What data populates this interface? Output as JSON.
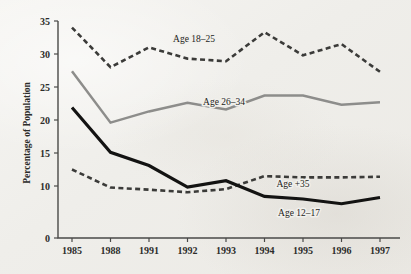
{
  "chart_data": {
    "type": "line",
    "title": "",
    "xlabel": "",
    "ylabel": "Percentage of Population",
    "categories": [
      "1985",
      "1988",
      "1991",
      "1992",
      "1993",
      "1994",
      "1995",
      "1996",
      "1997"
    ],
    "ylim": [
      0,
      35
    ],
    "yticks": [
      0,
      10,
      15,
      20,
      25,
      30,
      35
    ],
    "ytick_labels": [
      "0",
      "10",
      "15",
      "20",
      "25",
      "30",
      "35"
    ],
    "grid": false,
    "legend": "inline-annotations",
    "series": [
      {
        "name": "Age 18–25",
        "label": "Age 18–25",
        "style": "dashed",
        "color": "#3b3b39",
        "values": [
          34.0,
          28.0,
          31.0,
          29.3,
          28.9,
          33.3,
          29.8,
          31.5,
          27.3
        ]
      },
      {
        "name": "Age 26–34",
        "label": "Age 26–34",
        "style": "solid-gray",
        "color": "#8d8d8b",
        "values": [
          27.4,
          19.6,
          21.3,
          22.6,
          21.6,
          23.7,
          23.7,
          22.3,
          22.7
        ]
      },
      {
        "name": "Age +35",
        "label": "Age +35",
        "style": "dashed",
        "color": "#3b3b39",
        "values": [
          12.5,
          9.7,
          9.3,
          8.8,
          9.4,
          11.5,
          11.3,
          11.3,
          11.4
        ]
      },
      {
        "name": "Age 12–17",
        "label": "Age 12–17",
        "style": "solid-black",
        "color": "#131312",
        "values": [
          21.9,
          15.1,
          13.1,
          9.8,
          10.8,
          8.0,
          7.5,
          6.6,
          7.8
        ]
      }
    ],
    "annotations": [
      {
        "text": "Age 18–25",
        "x": 194,
        "y": 42
      },
      {
        "text": "Age 26–34",
        "x": 224,
        "y": 105
      },
      {
        "text": "Age +35",
        "x": 293,
        "y": 187
      },
      {
        "text": "Age 12–17",
        "x": 299,
        "y": 216
      }
    ]
  },
  "colors": {
    "background": "#f3f2ef",
    "axis": "#4a4a48",
    "text": "#2c2c2a",
    "series_black": "#131312",
    "series_gray": "#8d8d8b"
  }
}
